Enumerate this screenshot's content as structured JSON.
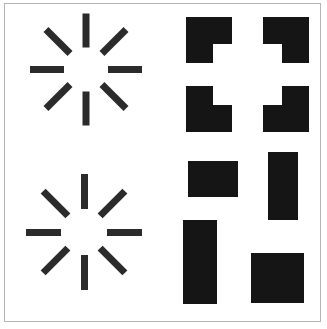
{
  "figure": {
    "title": "Visual perception stimuli grid",
    "description": "Two-by-two arrangement of black geometric stimuli on a white field enclosed by a thin gray rectangular frame",
    "width_px": 327,
    "height_px": 329,
    "background_color": "#ffffff",
    "frame_color": "#b4b4b4",
    "ink_color": "#151515",
    "spoke_color": "#2b2b2b"
  },
  "panels": [
    {
      "id": "panel-top-left",
      "name": "radial-starburst-upper",
      "label": "Radial starburst pattern, upper left",
      "stimulus_type": "radial-spokes",
      "spoke_count": 8,
      "center_x": 86,
      "center_y": 69,
      "inner_radius": 22,
      "outer_radius": 56,
      "spoke_thickness": 7,
      "spoke_angles_deg": [
        0,
        45,
        90,
        135,
        180,
        225,
        270,
        315
      ]
    },
    {
      "id": "panel-top-right",
      "name": "kanizsa-notched-squares",
      "label": "Four notched squares forming an illusory square",
      "stimulus_type": "notched-squares",
      "shape_count": 4,
      "shapes": [
        {
          "name": "notched-square-top-left",
          "x": 186,
          "y": 17,
          "size": 46,
          "notch_corner": "bottom-right",
          "notch_size": 19
        },
        {
          "name": "notched-square-top-right",
          "x": 263,
          "y": 17,
          "size": 46,
          "notch_corner": "bottom-left",
          "notch_size": 19
        },
        {
          "name": "notched-square-bottom-left",
          "x": 186,
          "y": 86,
          "size": 46,
          "notch_corner": "top-right",
          "notch_size": 19
        },
        {
          "name": "notched-square-bottom-right",
          "x": 263,
          "y": 86,
          "size": 46,
          "notch_corner": "top-left",
          "notch_size": 19
        }
      ]
    },
    {
      "id": "panel-bottom-left",
      "name": "radial-starburst-lower",
      "label": "Radial starburst pattern, lower left",
      "stimulus_type": "radial-spokes",
      "spoke_count": 8,
      "center_x": 84,
      "center_y": 232,
      "inner_radius": 23,
      "outer_radius": 58,
      "spoke_thickness": 7,
      "spoke_angles_deg": [
        0,
        45,
        90,
        135,
        180,
        225,
        270,
        315
      ]
    },
    {
      "id": "panel-bottom-right",
      "name": "solid-rectangles-group",
      "label": "Four solid black rectangles in varied orientations",
      "stimulus_type": "solid-rectangles",
      "shape_count": 4,
      "shapes": [
        {
          "name": "rectangle-horizontal-upper",
          "x": 188,
          "y": 161,
          "width": 50,
          "height": 36,
          "orientation": "horizontal"
        },
        {
          "name": "rectangle-vertical-upper",
          "x": 268,
          "y": 152,
          "width": 30,
          "height": 68,
          "orientation": "vertical"
        },
        {
          "name": "rectangle-vertical-tall",
          "x": 183,
          "y": 220,
          "width": 34,
          "height": 84,
          "orientation": "vertical"
        },
        {
          "name": "rectangle-square-lower",
          "x": 251,
          "y": 253,
          "width": 53,
          "height": 50,
          "orientation": "square"
        }
      ]
    }
  ]
}
